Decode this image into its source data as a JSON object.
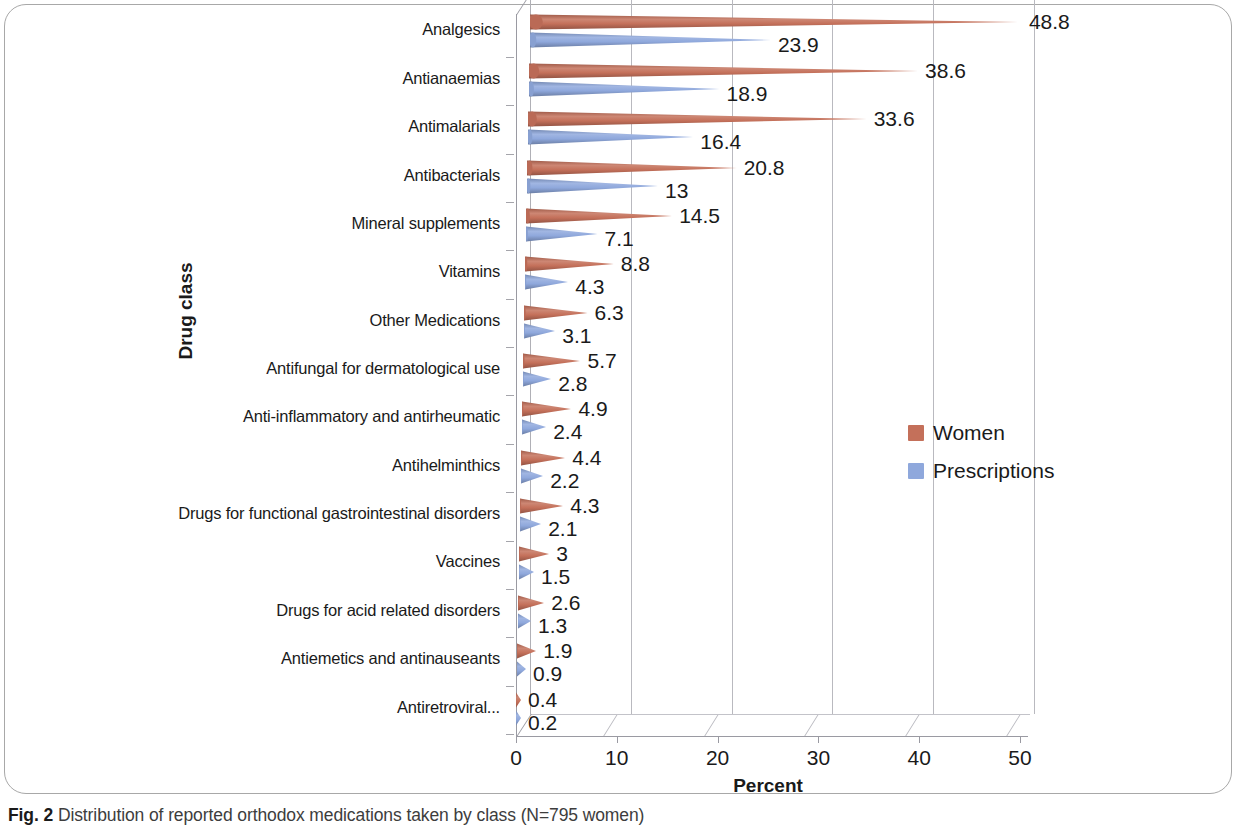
{
  "caption": {
    "figure_number": "Fig. 2",
    "text": "Distribution of reported orthodox medications taken by class (N=795 women)"
  },
  "chart_data": {
    "type": "bar",
    "orientation": "horizontal",
    "title": "",
    "xlabel": "Percent",
    "ylabel": "Drug class",
    "xlim": [
      0,
      50
    ],
    "xticks": [
      "0",
      "10",
      "20",
      "30",
      "40",
      "50"
    ],
    "grid": true,
    "legend_position": "center-right",
    "categories": [
      "Analgesics",
      "Antianaemias",
      "Antimalarials",
      "Antibacterials",
      "Mineral supplements",
      "Vitamins",
      "Other Medications",
      "Antifungal for dermatological use",
      "Anti-inflammatory and antirheumatic",
      "Antihelminthics",
      "Drugs for functional gastrointestinal disorders",
      "Vaccines",
      "Drugs for acid related disorders",
      "Antiemetics and antinauseants",
      "Antiretroviral..."
    ],
    "series": [
      {
        "name": "Women",
        "color": "#c4705a",
        "values": [
          48.8,
          38.6,
          33.6,
          20.8,
          14.5,
          8.8,
          6.3,
          5.7,
          4.9,
          4.4,
          4.3,
          3,
          2.6,
          1.9,
          0.4
        ],
        "labels": [
          "48.8",
          "38.6",
          "33.6",
          "20.8",
          "14.5",
          "8.8",
          "6.3",
          "5.7",
          "4.9",
          "4.4",
          "4.3",
          "3",
          "2.6",
          "1.9",
          "0.4"
        ]
      },
      {
        "name": "Prescriptions",
        "color": "#8fa8dc",
        "values": [
          23.9,
          18.9,
          16.4,
          13,
          7.1,
          4.3,
          3.1,
          2.8,
          2.4,
          2.2,
          2.1,
          1.5,
          1.3,
          0.9,
          0.2
        ],
        "labels": [
          "23.9",
          "18.9",
          "16.4",
          "13",
          "7.1",
          "4.3",
          "3.1",
          "2.8",
          "2.4",
          "2.2",
          "2.1",
          "1.5",
          "1.3",
          "0.9",
          "0.2"
        ]
      }
    ]
  }
}
